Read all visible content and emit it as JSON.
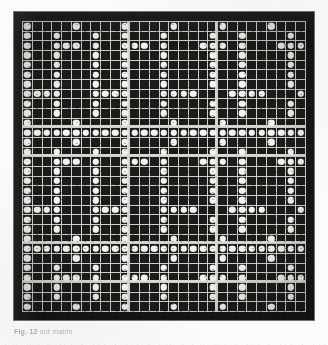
{
  "page": {
    "background_color": "#fbfbfa"
  },
  "plate": {
    "name": "dot-matrix-plate",
    "background_color": "#161616",
    "gridline_color": "#cfcfc8",
    "dot_color": "#f2f2ee",
    "rows": 30,
    "cols": 29,
    "legend": {
      "on": "dot present (punched / lit cell)",
      "off": "empty cell"
    },
    "rule_rows": [
      10,
      13,
      22,
      26
    ],
    "rule_cols": [
      10,
      19
    ],
    "matrix": [
      "10000100001000010000100001000",
      "10010001001000100001001000010",
      "10011101001110100011101000111",
      "10010001001000100001001000010",
      "10010001001000100001001000010",
      "10010001001000100001001000010",
      "10010001001000100001001000010",
      "11110001111000111100011110001",
      "10010001001000100001001000010",
      "10010001001000100001001000010",
      "10000100001000010000100001000",
      "11111111111111111111111111111",
      "10000100001000010000100001000",
      "10010001001000100001001000010",
      "10011101001110100011101000111",
      "10010001001000100001001000010",
      "10010001001000100001001000010",
      "10010001001000100001001000010",
      "10010001001000100001001000010",
      "11110001111000111100011110001",
      "10010001001000100001001000010",
      "10010001001000100001001000010",
      "10000100001000010000100001000",
      "11111111111111111111111111111",
      "10000100001000010000100001000",
      "10010001001000100001001000010",
      "10011101001110100011101000111",
      "10010001001000100001001000010",
      "10010001001000100001001000010",
      "10000100001000010000100001000"
    ]
  },
  "caption": {
    "label": "Fig. 12",
    "text": "dot matrix"
  }
}
